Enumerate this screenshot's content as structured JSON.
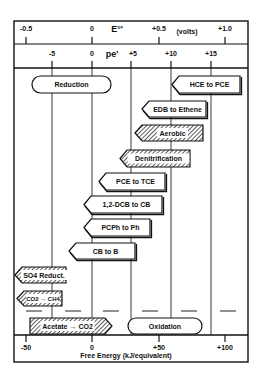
{
  "top_axis": {
    "label": "E°'",
    "unit": "(volts)",
    "ticks": [
      {
        "label": "-0.5",
        "x": 26
      },
      {
        "label": "0",
        "x": 92
      },
      {
        "label": "+0.5",
        "x": 159
      },
      {
        "label": "+1.0",
        "x": 225
      }
    ]
  },
  "pe_axis": {
    "label": "pe'",
    "ticks": [
      {
        "label": "-5",
        "x": 52
      },
      {
        "label": "0",
        "x": 92
      },
      {
        "label": "+5",
        "x": 131
      },
      {
        "label": "+10",
        "x": 171
      },
      {
        "label": "+15",
        "x": 211
      }
    ]
  },
  "bottom_axis": {
    "title": "Free Energy  (kJ/equivalent)",
    "ticks": [
      {
        "label": "-50",
        "x": 26
      },
      {
        "label": "0",
        "x": 92
      },
      {
        "label": "+50",
        "x": 159
      },
      {
        "label": "+100",
        "x": 225
      }
    ]
  },
  "colors": {
    "ink": "#111111",
    "hatch": "#555555",
    "background": "#ffffff"
  },
  "reactions": [
    {
      "label": "Reduction",
      "shape": "rounded",
      "hatched": false,
      "x1": 32,
      "x2": 111,
      "y1": 76,
      "y2": 93
    },
    {
      "label": "HCE to PCE",
      "shape": "arrow-left",
      "hatched": false,
      "x1": 172,
      "x2": 240,
      "y1": 76,
      "y2": 93
    },
    {
      "label": "EDB to Ethene",
      "shape": "arrow-left",
      "hatched": false,
      "x1": 142,
      "x2": 206,
      "y1": 101,
      "y2": 117
    },
    {
      "label": "Aerobic",
      "shape": "arrow-left",
      "hatched": true,
      "x1": 135,
      "x2": 203,
      "y1": 125,
      "y2": 141
    },
    {
      "label": "Denitrification",
      "shape": "arrow-left",
      "hatched": true,
      "x1": 120,
      "x2": 190,
      "y1": 150,
      "y2": 167
    },
    {
      "label": "PCE to TCE",
      "shape": "arrow-left",
      "hatched": false,
      "x1": 99,
      "x2": 165,
      "y1": 173,
      "y2": 190
    },
    {
      "label": "1,2-DCB to CB",
      "shape": "arrow-left",
      "hatched": false,
      "x1": 84,
      "x2": 162,
      "y1": 196,
      "y2": 213
    },
    {
      "label": "PCPh to Ph",
      "shape": "arrow-left",
      "hatched": false,
      "x1": 84,
      "x2": 150,
      "y1": 219,
      "y2": 236
    },
    {
      "label": "CB to B",
      "shape": "arrow-left",
      "hatched": false,
      "x1": 69,
      "x2": 135,
      "y1": 243,
      "y2": 259
    },
    {
      "label": "SO4 Reduct.",
      "shape": "arrow-left",
      "hatched": true,
      "x1": 15,
      "x2": 66,
      "y1": 267,
      "y2": 283
    },
    {
      "label": "CO2 → CH4",
      "shape": "arrow-left",
      "hatched": true,
      "x1": 17,
      "x2": 62,
      "y1": 291,
      "y2": 306
    },
    {
      "label": "Acetate → CO2",
      "shape": "arrow-right",
      "hatched": true,
      "x1": 30,
      "x2": 112,
      "y1": 318,
      "y2": 334
    },
    {
      "label": "Oxidation",
      "shape": "rounded",
      "hatched": false,
      "x1": 128,
      "x2": 202,
      "y1": 318,
      "y2": 334
    }
  ],
  "dashed_baseline": {
    "y": 311,
    "segments": [
      [
        26,
        42
      ],
      [
        65,
        81
      ],
      [
        103,
        119
      ],
      [
        142,
        158
      ],
      [
        181,
        197
      ],
      [
        220,
        236
      ]
    ]
  }
}
